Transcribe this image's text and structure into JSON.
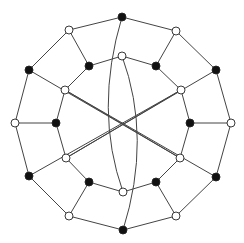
{
  "diagram": {
    "type": "graph",
    "colors": {
      "edge": "#444444",
      "node_black": "#111111",
      "node_white": "#ffffff",
      "node_stroke": "#222222"
    },
    "node_radius": 4,
    "nodes": [
      {
        "id": "o0",
        "x": 122,
        "y": 17,
        "fill": "black"
      },
      {
        "id": "o1",
        "x": 176,
        "y": 31,
        "fill": "white"
      },
      {
        "id": "o2",
        "x": 216,
        "y": 70,
        "fill": "black"
      },
      {
        "id": "o3",
        "x": 231,
        "y": 123,
        "fill": "white"
      },
      {
        "id": "o4",
        "x": 216,
        "y": 177,
        "fill": "black"
      },
      {
        "id": "o5",
        "x": 176,
        "y": 216,
        "fill": "white"
      },
      {
        "id": "o6",
        "x": 123,
        "y": 230,
        "fill": "black"
      },
      {
        "id": "o7",
        "x": 69,
        "y": 216,
        "fill": "white"
      },
      {
        "id": "o8",
        "x": 29,
        "y": 176,
        "fill": "black"
      },
      {
        "id": "o9",
        "x": 15,
        "y": 123,
        "fill": "white"
      },
      {
        "id": "o10",
        "x": 29,
        "y": 70,
        "fill": "black"
      },
      {
        "id": "o11",
        "x": 69,
        "y": 30,
        "fill": "white"
      },
      {
        "id": "i0",
        "x": 122,
        "y": 56,
        "fill": "white"
      },
      {
        "id": "i1",
        "x": 156,
        "y": 66,
        "fill": "black"
      },
      {
        "id": "i2",
        "x": 181,
        "y": 90,
        "fill": "white"
      },
      {
        "id": "i3",
        "x": 190,
        "y": 123,
        "fill": "black"
      },
      {
        "id": "i4",
        "x": 180,
        "y": 158,
        "fill": "white"
      },
      {
        "id": "i5",
        "x": 156,
        "y": 182,
        "fill": "black"
      },
      {
        "id": "i6",
        "x": 123,
        "y": 192,
        "fill": "white"
      },
      {
        "id": "i7",
        "x": 89,
        "y": 182,
        "fill": "black"
      },
      {
        "id": "i8",
        "x": 66,
        "y": 158,
        "fill": "white"
      },
      {
        "id": "i9",
        "x": 56,
        "y": 123,
        "fill": "black"
      },
      {
        "id": "i10",
        "x": 65,
        "y": 90,
        "fill": "white"
      },
      {
        "id": "i11",
        "x": 89,
        "y": 66,
        "fill": "black"
      }
    ],
    "edges": [
      [
        "o0",
        "o1"
      ],
      [
        "o1",
        "o2"
      ],
      [
        "o2",
        "o3"
      ],
      [
        "o3",
        "o4"
      ],
      [
        "o4",
        "o5"
      ],
      [
        "o5",
        "o6"
      ],
      [
        "o6",
        "o7"
      ],
      [
        "o7",
        "o8"
      ],
      [
        "o8",
        "o9"
      ],
      [
        "o9",
        "o10"
      ],
      [
        "o10",
        "o11"
      ],
      [
        "o11",
        "o0"
      ],
      [
        "o1",
        "i1"
      ],
      [
        "o3",
        "i3"
      ],
      [
        "o5",
        "i5"
      ],
      [
        "o7",
        "i7"
      ],
      [
        "o9",
        "i9"
      ],
      [
        "o11",
        "i11"
      ],
      [
        "i0",
        "i1"
      ],
      [
        "i1",
        "i2"
      ],
      [
        "i2",
        "i3"
      ],
      [
        "i3",
        "i4"
      ],
      [
        "i4",
        "i5"
      ],
      [
        "i5",
        "i6"
      ],
      [
        "i6",
        "i7"
      ],
      [
        "i7",
        "i8"
      ],
      [
        "i8",
        "i9"
      ],
      [
        "i9",
        "i10"
      ],
      [
        "i10",
        "i11"
      ],
      [
        "i11",
        "i0"
      ],
      [
        "i10",
        "i4"
      ],
      [
        "i8",
        "i2"
      ],
      [
        "o10",
        "i4"
      ],
      [
        "i10",
        "o4"
      ],
      [
        "o8",
        "i2"
      ],
      [
        "i8",
        "o2"
      ]
    ],
    "curved_edges": [
      {
        "from": "o0",
        "to": "i6",
        "ctrl_x": 94,
        "ctrl_y": 110
      },
      {
        "from": "i0",
        "to": "o6",
        "ctrl_x": 152,
        "ctrl_y": 138
      }
    ]
  }
}
